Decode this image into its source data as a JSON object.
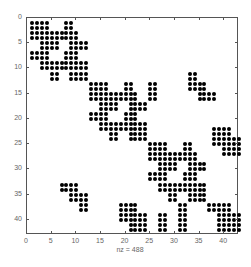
{
  "chart_data": {
    "type": "scatter",
    "subtype": "sparsity-pattern (spy)",
    "title": "",
    "xlabel": "nz = 488",
    "ylabel": "",
    "xlim": [
      0,
      43
    ],
    "ylim": [
      43,
      0
    ],
    "x_ticks": [
      0,
      5,
      10,
      15,
      20,
      25,
      30,
      35,
      40
    ],
    "y_ticks": [
      0,
      5,
      10,
      15,
      20,
      25,
      30,
      35,
      40
    ],
    "nz": 488,
    "marker": "filled dot",
    "marker_color": "#000000",
    "diagonal_block_pattern_12x12": [
      [
        [
          1,
          4
        ],
        [
          8,
          9
        ]
      ],
      [
        [
          1,
          4
        ],
        [
          8,
          9
        ]
      ],
      [
        [
          1,
          10
        ]
      ],
      [
        [
          1,
          10
        ]
      ],
      [
        [
          3,
          6
        ],
        [
          9,
          12
        ]
      ],
      [
        [
          3,
          6
        ],
        [
          9,
          12
        ]
      ],
      [
        [
          1,
          4
        ],
        [
          8,
          10
        ]
      ],
      [
        [
          1,
          4
        ],
        [
          8,
          10
        ]
      ],
      [
        [
          3,
          12
        ]
      ],
      [
        [
          3,
          12
        ]
      ],
      [
        [
          5,
          6
        ],
        [
          9,
          12
        ]
      ],
      [
        [
          5,
          6
        ],
        [
          9,
          12
        ]
      ]
    ],
    "diagonal_block_offsets": [
      0,
      12,
      24
    ],
    "off_diagonal_rects": [
      {
        "rows": [
          11,
          12
        ],
        "cols": [
          33,
          34
        ]
      },
      {
        "rows": [
          13,
          14
        ],
        "cols": [
          33,
          36
        ]
      },
      {
        "rows": [
          15,
          16
        ],
        "cols": [
          35,
          38
        ]
      },
      {
        "rows": [
          22,
          23
        ],
        "cols": [
          38,
          41
        ]
      },
      {
        "rows": [
          24,
          25
        ],
        "cols": [
          38,
          43
        ]
      },
      {
        "rows": [
          26,
          27
        ],
        "cols": [
          40,
          43
        ]
      },
      {
        "rows": [
          33,
          34
        ],
        "cols": [
          7,
          10
        ]
      },
      {
        "rows": [
          35,
          36
        ],
        "cols": [
          9,
          12
        ]
      },
      {
        "rows": [
          37,
          38
        ],
        "cols": [
          11,
          12
        ]
      },
      {
        "rows": [
          37,
          38
        ],
        "cols": [
          19,
          22
        ]
      },
      {
        "rows": [
          39,
          40
        ],
        "cols": [
          19,
          24
        ]
      },
      {
        "rows": [
          41,
          42
        ],
        "cols": [
          21,
          24
        ]
      },
      {
        "rows": [
          39,
          42
        ],
        "cols": [
          27,
          28
        ]
      },
      {
        "rows": [
          37,
          42
        ],
        "cols": [
          31,
          32
        ]
      },
      {
        "rows": [
          37,
          38
        ],
        "cols": [
          37,
          41
        ]
      },
      {
        "rows": [
          39,
          42
        ],
        "cols": [
          39,
          43
        ]
      },
      {
        "rows": [
          13,
          16
        ],
        "cols": [
          25,
          26
        ]
      }
    ]
  }
}
